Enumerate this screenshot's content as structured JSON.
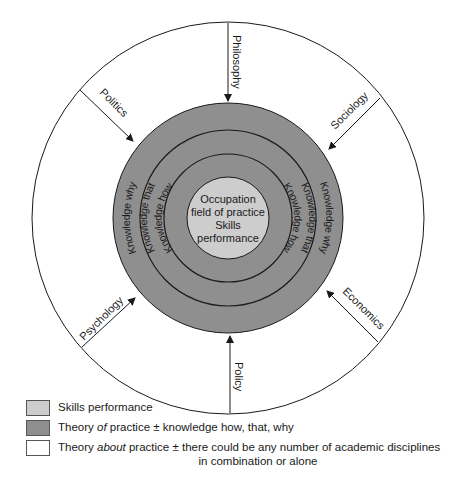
{
  "colors": {
    "skills": "#cdcdcd",
    "theory_of": "#8f8f8f",
    "theory_about": "#ffffff",
    "stroke": "#1a1a1a"
  },
  "center": {
    "lines": [
      "Occupation",
      "field of practice",
      "Skills",
      "performance"
    ]
  },
  "rings": {
    "left": [
      "Knowledge why",
      "Knowledge that",
      "Knowledge how"
    ],
    "right": [
      "Knowledge how",
      "Knowledge that",
      "Knowledge why"
    ]
  },
  "disciplines": [
    {
      "label": "Philosophy",
      "position": "top"
    },
    {
      "label": "Sociology",
      "position": "top-right"
    },
    {
      "label": "Economics",
      "position": "bottom-right"
    },
    {
      "label": "Policy",
      "position": "bottom"
    },
    {
      "label": "Psychology",
      "position": "bottom-left"
    },
    {
      "label": "Politics",
      "position": "top-left"
    }
  ],
  "legend": [
    {
      "swatch": "skills",
      "text": "Skills performance"
    },
    {
      "swatch": "theory_of",
      "prefix": "Theory ",
      "em": "of",
      "suffix": " practice ± knowledge how, that, why"
    },
    {
      "swatch": "theory_about",
      "prefix": "Theory ",
      "em": "about",
      "suffix": " practice ± there could be any number of academic disciplines",
      "continuation": "in combination or alone"
    }
  ]
}
